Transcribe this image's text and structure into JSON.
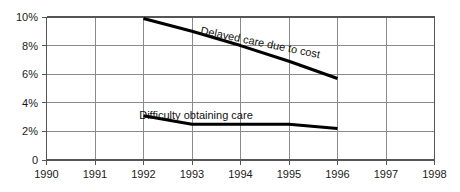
{
  "chart_data": {
    "type": "line",
    "title": "",
    "subtitle": "",
    "xlabel": "",
    "ylabel": "",
    "xlim": [
      1990,
      1998
    ],
    "ylim": [
      0,
      10
    ],
    "grid": true,
    "legend_position": "inline-annotation",
    "x_tick_labels": [
      "1990",
      "1991",
      "1992",
      "1993",
      "1994",
      "1995",
      "1996",
      "1997",
      "1998"
    ],
    "y_tick_labels": [
      "0",
      "2%",
      "4%",
      "6%",
      "8%",
      "10%"
    ],
    "y_tick_values": [
      0,
      2,
      4,
      6,
      8,
      10
    ],
    "series": [
      {
        "name": "Delayed care due to cost",
        "x": [
          1992,
          1993,
          1994,
          1995,
          1996
        ],
        "values": [
          9.9,
          9.0,
          8.0,
          6.9,
          5.7
        ]
      },
      {
        "name": "Difficulty obtaining care",
        "x": [
          1992,
          1993,
          1994,
          1995,
          1996
        ],
        "values": [
          3.1,
          2.5,
          2.5,
          2.5,
          2.2
        ]
      }
    ],
    "annotations": [
      {
        "text": "Delayed care due to cost",
        "series": "Delayed care due to cost",
        "rotated": true
      },
      {
        "text": "Difficulty obtaining care",
        "series": "Difficulty obtaining care",
        "rotated": false
      }
    ],
    "colors": {
      "line": "#000000",
      "grid": "#8a8a8a",
      "axis": "#555555",
      "text": "#1a1a1a"
    }
  },
  "axes": {
    "y_ticks": [
      {
        "label": "10%",
        "y": 17
      },
      {
        "label": "8%",
        "y": 45.6
      },
      {
        "label": "6%",
        "y": 74.2
      },
      {
        "label": "4%",
        "y": 102.8
      },
      {
        "label": "2%",
        "y": 131.4
      },
      {
        "label": "0",
        "y": 160
      }
    ],
    "x_ticks": [
      {
        "label": "1990",
        "x": 46.5
      },
      {
        "label": "1991",
        "x": 95
      },
      {
        "label": "1992",
        "x": 143.5
      },
      {
        "label": "1993",
        "x": 192
      },
      {
        "label": "1994",
        "x": 240.5
      },
      {
        "label": "1995",
        "x": 289
      },
      {
        "label": "1996",
        "x": 337.5
      },
      {
        "label": "1997",
        "x": 386
      },
      {
        "label": "1998",
        "x": 434.5
      }
    ]
  },
  "annotations": {
    "delayed_label": "Delayed care due to cost",
    "difficulty_label": "Difficulty obtaining care"
  }
}
